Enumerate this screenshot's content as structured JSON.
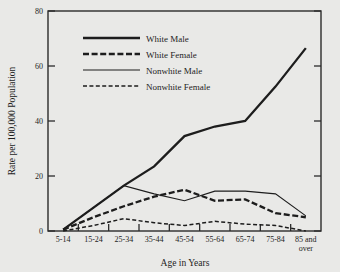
{
  "chart_data": {
    "type": "line",
    "title": "",
    "xlabel": "Age in Years",
    "ylabel": "Rate per 100,000 Population",
    "categories": [
      "5-14",
      "15-24",
      "25-34",
      "35-44",
      "45-54",
      "55-64",
      "65-74",
      "75-84",
      "85 and over"
    ],
    "x_tick_labels": [
      "5-14",
      "15-24",
      "25-34",
      "35-44",
      "45-54",
      "55-64",
      "65-74",
      "75-84",
      "85 and over"
    ],
    "x_tick_label_line2": [
      "",
      "",
      "",
      "",
      "",
      "",
      "",
      "",
      "over"
    ],
    "y_ticks": [
      0,
      20,
      40,
      60,
      80
    ],
    "y_tick_labels": [
      "0",
      "20",
      "40",
      "60",
      "80"
    ],
    "ylim": [
      0,
      80
    ],
    "grid": false,
    "legend_position": "upper-center",
    "series": [
      {
        "name": "White Male",
        "style": "thick-solid",
        "color": "#1d1d1d",
        "values": [
          0.5,
          8.5,
          16.5,
          23.5,
          34.5,
          38.0,
          40.0,
          52.5,
          66.5
        ]
      },
      {
        "name": "White Female",
        "style": "thick-dashed",
        "color": "#1d1d1d",
        "values": [
          0.5,
          5.0,
          9.0,
          12.5,
          15.0,
          11.0,
          11.5,
          6.5,
          5.0
        ]
      },
      {
        "name": "Nonwhite Male",
        "style": "thin-solid",
        "color": "#1d1d1d",
        "values": [
          0.5,
          8.5,
          16.5,
          13.5,
          11.0,
          14.5,
          14.5,
          13.5,
          5.5
        ]
      },
      {
        "name": "Nonwhite Female",
        "style": "thin-dashed",
        "color": "#1d1d1d",
        "values": [
          0.0,
          2.0,
          4.5,
          3.0,
          2.0,
          3.5,
          2.5,
          2.0,
          0.0
        ]
      }
    ]
  },
  "legend": {
    "items": [
      {
        "label": "White Male"
      },
      {
        "label": "White Female"
      },
      {
        "label": "Nonwhite Male"
      },
      {
        "label": "Nonwhite Female"
      }
    ]
  },
  "axes": {
    "y_title": "Rate per 100,000 Population",
    "x_title": "Age in Years"
  }
}
